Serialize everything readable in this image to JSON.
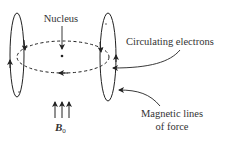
{
  "diagram": {
    "labels": {
      "nucleus": "Nucleus",
      "circulating_electrons": "Circulating electrons",
      "magnetic_lines_line1": "Magnetic lines",
      "magnetic_lines_line2": "of force",
      "field_symbol": "B",
      "field_subscript": "0"
    },
    "colors": {
      "stroke": "#222222",
      "text": "#333333",
      "background": "#ffffff"
    }
  }
}
